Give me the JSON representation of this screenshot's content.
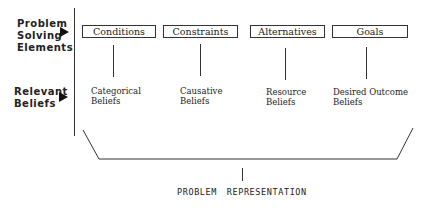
{
  "side_labels": {
    "problem_solving": {
      "line1": "Problem",
      "line2": "Solving",
      "line3": "Elements"
    },
    "relevant_beliefs": {
      "line1": "Relevant",
      "line2": "Beliefs"
    }
  },
  "elements": [
    {
      "label": "Conditions",
      "belief_line1": "Categorical",
      "belief_line2": "Beliefs"
    },
    {
      "label": "Constraints",
      "belief_line1": "Causative",
      "belief_line2": "Beliefs"
    },
    {
      "label": "Alternatives",
      "belief_line1": "Resource",
      "belief_line2": "Beliefs"
    },
    {
      "label": "Goals",
      "belief_line1": "Desired Outcome",
      "belief_line2": "Beliefs"
    }
  ],
  "footer": {
    "label": "PROBLEM  REPRESENTATION"
  },
  "colors": {
    "line": "#333333",
    "text": "#222222",
    "background": "#ffffff"
  }
}
